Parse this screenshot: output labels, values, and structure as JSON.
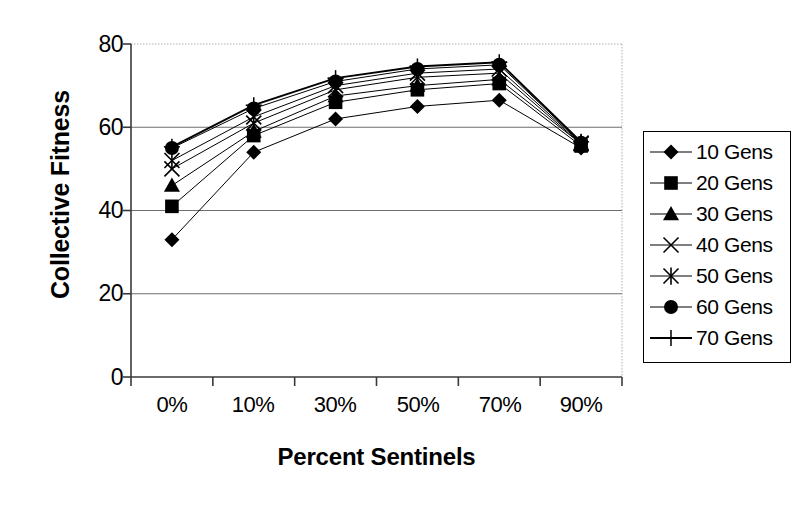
{
  "chart_data": {
    "type": "line",
    "title": "",
    "xlabel": "Percent Sentinels",
    "ylabel": "Collective Fitness",
    "categories": [
      "0%",
      "10%",
      "30%",
      "50%",
      "70%",
      "90%"
    ],
    "ylim": [
      0,
      80
    ],
    "yticks": [
      0,
      20,
      40,
      60,
      80
    ],
    "grid": true,
    "legend_position": "right",
    "series": [
      {
        "name": "10 Gens",
        "marker": "diamond",
        "values": [
          33.0,
          54.0,
          62.0,
          65.0,
          66.5,
          55.0
        ]
      },
      {
        "name": "20 Gens",
        "marker": "square",
        "values": [
          41.0,
          58.0,
          66.0,
          69.0,
          70.5,
          55.5
        ]
      },
      {
        "name": "30 Gens",
        "marker": "triangle",
        "values": [
          46.0,
          59.0,
          67.5,
          70.0,
          71.5,
          56.0
        ]
      },
      {
        "name": "40 Gens",
        "marker": "x",
        "values": [
          50.0,
          61.0,
          69.0,
          72.0,
          73.0,
          56.0
        ]
      },
      {
        "name": "50 Gens",
        "marker": "star",
        "values": [
          52.0,
          62.5,
          70.0,
          73.0,
          74.0,
          56.2
        ]
      },
      {
        "name": "60 Gens",
        "marker": "circle",
        "values": [
          55.0,
          64.5,
          71.0,
          74.0,
          75.0,
          56.3
        ]
      },
      {
        "name": "70 Gens",
        "marker": "plus",
        "values": [
          55.3,
          65.3,
          71.8,
          74.6,
          75.6,
          56.5
        ]
      }
    ]
  },
  "axis": {
    "y_tick_labels": [
      "80",
      "60",
      "40",
      "20",
      "0"
    ],
    "x_tick_labels": [
      "0%",
      "10%",
      "30%",
      "50%",
      "70%",
      "90%"
    ],
    "y_title": "Collective Fitness",
    "x_title": "Percent Sentinels"
  },
  "legend": {
    "items": [
      {
        "label": "10 Gens"
      },
      {
        "label": "20 Gens"
      },
      {
        "label": "30 Gens"
      },
      {
        "label": "40 Gens"
      },
      {
        "label": "50 Gens"
      },
      {
        "label": "60 Gens"
      },
      {
        "label": "70 Gens"
      }
    ]
  },
  "colors": {
    "series": "#000000",
    "grid": "#7f7f7f",
    "plot_border": "#b0b0b0",
    "background": "#ffffff"
  }
}
